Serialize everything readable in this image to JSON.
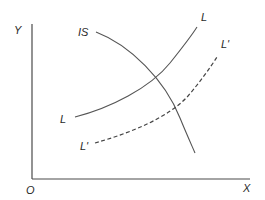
{
  "diagram": {
    "type": "economics-curve-diagram",
    "axes": {
      "y_label": "Y",
      "x_label": "X",
      "origin_label": "O"
    },
    "curves": [
      {
        "id": "IS",
        "label": "IS",
        "style": "solid",
        "slope": "downward"
      },
      {
        "id": "L",
        "label_start": "L",
        "label_end": "L",
        "style": "solid",
        "slope": "upward"
      },
      {
        "id": "L_prime",
        "label_start": "L'",
        "label_end": "L'",
        "style": "dashed",
        "slope": "upward"
      }
    ],
    "colors": {
      "background": "#ffffff",
      "lines": "#555555",
      "text": "#2a2a2a"
    }
  }
}
